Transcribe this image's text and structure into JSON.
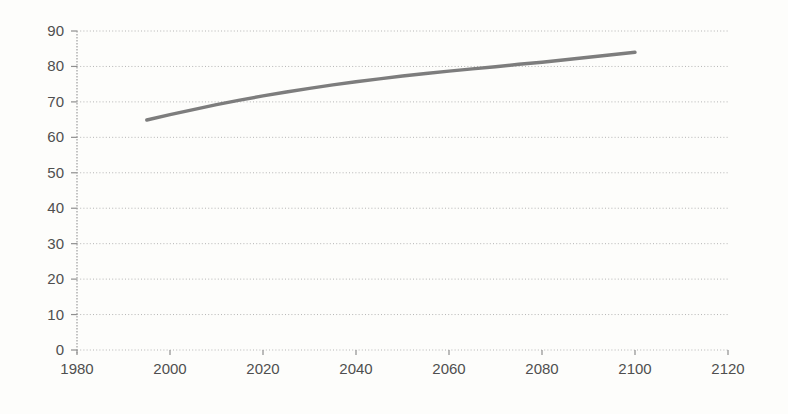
{
  "chart_data": {
    "type": "line",
    "title": "",
    "subtitle": "",
    "xlabel": "",
    "ylabel": "",
    "legend": "none",
    "grid": "horizontal-dotted",
    "xlim": [
      1980,
      2120
    ],
    "ylim": [
      0,
      90
    ],
    "x_ticks": [
      1980,
      2000,
      2020,
      2040,
      2060,
      2080,
      2100,
      2120
    ],
    "y_ticks": [
      0,
      10,
      20,
      30,
      40,
      50,
      60,
      70,
      80,
      90
    ],
    "x": [
      1995,
      2000,
      2005,
      2010,
      2015,
      2020,
      2025,
      2030,
      2035,
      2040,
      2045,
      2050,
      2055,
      2060,
      2065,
      2070,
      2075,
      2080,
      2085,
      2090,
      2095,
      2100
    ],
    "series": [
      {
        "name": "projection-line",
        "values": [
          64.9,
          66.4,
          67.8,
          69.2,
          70.5,
          71.7,
          72.8,
          73.8,
          74.8,
          75.7,
          76.5,
          77.3,
          78.0,
          78.7,
          79.3,
          79.9,
          80.6,
          81.2,
          81.9,
          82.6,
          83.3,
          84.0
        ]
      }
    ],
    "colors": {
      "background": "#fdfdfb",
      "line": "#7d7d7d",
      "gridline": "#b5b5b5",
      "axis": "#9e9e9e",
      "tick": "#8f8f8f",
      "label": "#4f4f4f"
    }
  }
}
